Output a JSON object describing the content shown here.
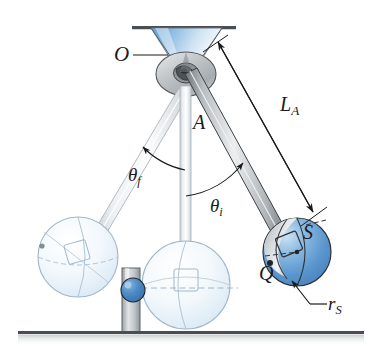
{
  "figure": {
    "background_color": "#ffffff"
  },
  "labels": {
    "pivot": "O",
    "rod": "A",
    "rod_length": "L",
    "rod_length_sub": "A",
    "angle_final": "θ",
    "angle_final_sub": "f",
    "angle_initial": "θ",
    "angle_initial_sub": "i",
    "sphere": "S",
    "contact_point": "Q",
    "sphere_radius": "r",
    "sphere_radius_sub": "S"
  },
  "colors": {
    "sphere_blue": "#4f8ec9",
    "sphere_blue_light": "#aecde8",
    "cone_blue": "#7fb4de",
    "hub_gray": "#b9bdc0",
    "rod_gray": "#9aa0a4",
    "ghost_blue": "#dfeaf4",
    "post_gray": "#b0b5b9",
    "ball_blue": "#3d7fc1",
    "ink": "#1a1a1a",
    "ground": "#6f7276"
  },
  "geometry": {
    "pivot_point": {
      "x": 185,
      "y": 72
    },
    "ceiling_y": 27,
    "ground_y": 333,
    "sphere_S_center": {
      "x": 297,
      "y": 252
    },
    "sphere_S_radius": 34,
    "sphere_rest_center": {
      "x": 186,
      "y": 285
    },
    "sphere_final_center": {
      "x": 78,
      "y": 257
    },
    "post_ball_center": {
      "x": 133,
      "y": 290
    }
  },
  "parts": [
    {
      "name": "ceiling-line",
      "kind": "line"
    },
    {
      "name": "support-cone",
      "kind": "cone"
    },
    {
      "name": "pivot-hub",
      "kind": "disk"
    },
    {
      "name": "rod-initial",
      "kind": "rod"
    },
    {
      "name": "rod-rest",
      "kind": "rod"
    },
    {
      "name": "rod-final",
      "kind": "rod"
    },
    {
      "name": "sphere-initial",
      "kind": "sphere"
    },
    {
      "name": "sphere-rest",
      "kind": "sphere-ghost"
    },
    {
      "name": "sphere-final",
      "kind": "sphere-ghost"
    },
    {
      "name": "post",
      "kind": "post"
    },
    {
      "name": "post-ball",
      "kind": "ball"
    },
    {
      "name": "ground-line",
      "kind": "line"
    }
  ]
}
